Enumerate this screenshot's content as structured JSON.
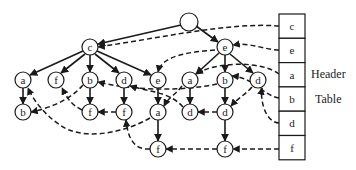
{
  "diagram": {
    "root": {
      "id": "root",
      "label": "",
      "x": 189,
      "y": 22
    },
    "nodes": [
      {
        "id": "c1",
        "label": "c",
        "x": 90,
        "y": 47
      },
      {
        "id": "e1",
        "label": "e",
        "x": 225,
        "y": 47
      },
      {
        "id": "a1",
        "label": "a",
        "x": 23,
        "y": 80
      },
      {
        "id": "f1",
        "label": "f",
        "x": 56,
        "y": 80
      },
      {
        "id": "b1",
        "label": "b",
        "x": 90,
        "y": 80
      },
      {
        "id": "d1",
        "label": "d",
        "x": 124,
        "y": 80
      },
      {
        "id": "e2",
        "label": "e",
        "x": 158,
        "y": 80
      },
      {
        "id": "a2",
        "label": "a",
        "x": 190,
        "y": 80
      },
      {
        "id": "b2",
        "label": "b",
        "x": 225,
        "y": 80
      },
      {
        "id": "d2",
        "label": "d",
        "x": 258,
        "y": 80
      },
      {
        "id": "b3",
        "label": "b",
        "x": 23,
        "y": 112
      },
      {
        "id": "f2",
        "label": "f",
        "x": 90,
        "y": 112
      },
      {
        "id": "f3",
        "label": "f",
        "x": 124,
        "y": 112
      },
      {
        "id": "a3",
        "label": "a",
        "x": 158,
        "y": 112
      },
      {
        "id": "d3",
        "label": "d",
        "x": 190,
        "y": 112
      },
      {
        "id": "d4",
        "label": "d",
        "x": 225,
        "y": 112
      },
      {
        "id": "f4",
        "label": "f",
        "x": 158,
        "y": 149
      },
      {
        "id": "f5",
        "label": "f",
        "x": 225,
        "y": 149
      }
    ],
    "tree_edges": [
      [
        "root",
        "c1"
      ],
      [
        "root",
        "e1"
      ],
      [
        "c1",
        "a1"
      ],
      [
        "c1",
        "f1"
      ],
      [
        "c1",
        "b1"
      ],
      [
        "c1",
        "d1"
      ],
      [
        "c1",
        "e2"
      ],
      [
        "e1",
        "a2"
      ],
      [
        "e1",
        "b2"
      ],
      [
        "e1",
        "d2"
      ],
      [
        "a1",
        "b3"
      ],
      [
        "b1",
        "f2"
      ],
      [
        "d1",
        "f3"
      ],
      [
        "e2",
        "a3"
      ],
      [
        "a2",
        "d3"
      ],
      [
        "b2",
        "d4"
      ],
      [
        "a3",
        "f4"
      ],
      [
        "d4",
        "f5"
      ]
    ],
    "header_table": {
      "label_line1": "Header",
      "label_line2": "Table",
      "x": 279,
      "y": 14,
      "width": 26,
      "cell_height": 24.3,
      "items": [
        "c",
        "e",
        "a",
        "b",
        "d",
        "f"
      ]
    }
  }
}
